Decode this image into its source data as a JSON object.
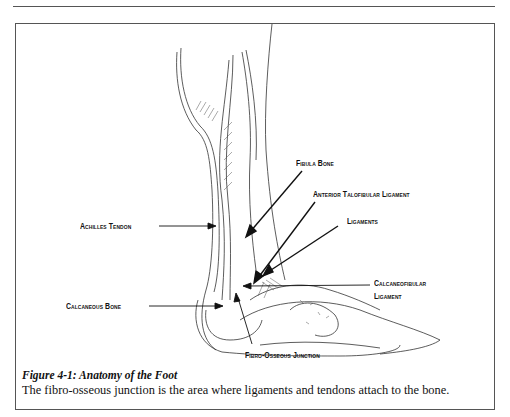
{
  "figure": {
    "labels": {
      "fibula_bone": "Fibula Bone",
      "anterior_talofibular_ligament": "Anterior Talofibular Ligament",
      "ligaments": "Ligaments",
      "achilles_tendon": "Achilles Tendon",
      "calcaneofibular_ligament_line1": "Calcaneofibular",
      "calcaneofibular_ligament_line2": "Ligament",
      "calcaneous_bone": "Calcaneous Bone",
      "fibro_osseous_junction": "Fibro-Osseous Junction"
    },
    "caption_title": "Figure 4-1:  Anatomy of the Foot",
    "caption_text": "The fibro-osseous junction is the area where ligaments and tendons attach to the bone."
  }
}
